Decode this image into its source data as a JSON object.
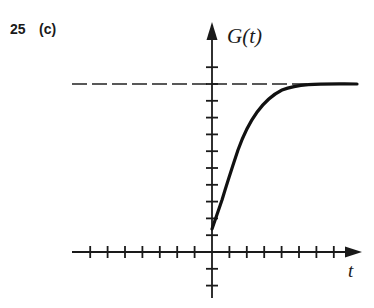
{
  "problem": {
    "number": "25",
    "part": "(c)"
  },
  "chart_data": {
    "type": "line",
    "title": "",
    "xlabel": "t",
    "ylabel": "G(t)",
    "grid": false,
    "legend": null,
    "x_ticks_left": 7,
    "x_ticks_right": 7,
    "y_ticks_above": 11,
    "y_ticks_below": 2,
    "xlim": [
      -7,
      8.5
    ],
    "ylim": [
      -2.3,
      13.7
    ],
    "asymptote": {
      "y": 10,
      "style": "dashed",
      "label": ""
    },
    "series": [
      {
        "name": "G(t)",
        "description": "Increasing curve approaching horizontal asymptote from below, starting at t=0",
        "x": [
          0,
          0.5,
          1,
          1.5,
          2,
          2.5,
          3,
          3.5,
          4,
          5,
          6,
          7,
          8.5
        ],
        "y": [
          1.4,
          3.0,
          4.6,
          6.1,
          7.3,
          8.3,
          9.0,
          9.5,
          9.75,
          9.92,
          9.97,
          9.99,
          10.0
        ]
      }
    ],
    "colors": {
      "curve": "#111111",
      "axes": "#1a1a1a",
      "asymptote": "#222222"
    }
  }
}
